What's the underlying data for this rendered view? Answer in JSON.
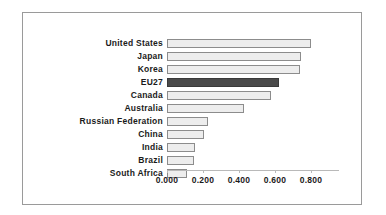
{
  "chart_data": {
    "type": "bar",
    "orientation": "horizontal",
    "title": "",
    "subtitle": "",
    "xlabel": "",
    "ylabel": "",
    "categories": [
      "United States",
      "Japan",
      "Korea",
      "EU27",
      "Canada",
      "Australia",
      "Russian Federation",
      "China",
      "India",
      "Brazil",
      "South Africa"
    ],
    "values": [
      0.8,
      0.745,
      0.74,
      0.62,
      0.58,
      0.43,
      0.23,
      0.205,
      0.155,
      0.15,
      0.11
    ],
    "series": [
      {
        "name": "",
        "values": [
          0.8,
          0.745,
          0.74,
          0.62,
          0.58,
          0.43,
          0.23,
          0.205,
          0.155,
          0.15,
          0.11
        ]
      }
    ],
    "highlight_category": "EU27",
    "highlight_index": 3,
    "xlim": [
      0.0,
      0.8
    ],
    "xticks": [
      0.0,
      0.2,
      0.4,
      0.6,
      0.8
    ],
    "xtick_labels": [
      "0.000",
      "0.200",
      "0.400",
      "0.600",
      "0.800"
    ],
    "grid": false,
    "legend": false,
    "legend_position": "none",
    "colors": {
      "bar_fill": "#ededed",
      "bar_border": "#8c8c8c",
      "highlight_fill": "#4a4a4a",
      "highlight_border": "#3a3a3a",
      "axis": "#b9b9b9",
      "frame": "#9a9a9a",
      "text": "#1b1b1b",
      "background": "#ffffff"
    }
  }
}
